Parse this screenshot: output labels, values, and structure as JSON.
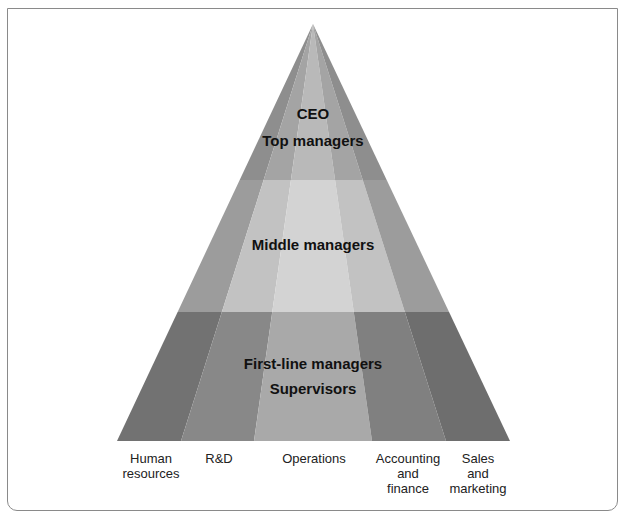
{
  "diagram": {
    "type": "pyramid",
    "tiers": [
      {
        "id": "top",
        "lines": [
          "CEO",
          "Top managers"
        ]
      },
      {
        "id": "middle",
        "lines": [
          "Middle managers"
        ]
      },
      {
        "id": "bottom",
        "lines": [
          "First-line managers",
          "Supervisors"
        ]
      }
    ],
    "columns": [
      {
        "label_lines": [
          "Human",
          "resources"
        ]
      },
      {
        "label_lines": [
          "R&D"
        ]
      },
      {
        "label_lines": [
          "Operations"
        ]
      },
      {
        "label_lines": [
          "Accounting",
          "and",
          "finance"
        ]
      },
      {
        "label_lines": [
          "Sales",
          "and",
          "marketing"
        ]
      }
    ],
    "colors": {
      "top": [
        "#8e8e8e",
        "#a4a4a4",
        "#b9b9b9",
        "#a4a4a4",
        "#8e8e8e"
      ],
      "middle": [
        "#9c9c9c",
        "#c2c2c2",
        "#d3d3d3",
        "#c2c2c2",
        "#9c9c9c"
      ],
      "bottom": [
        "#727272",
        "#888888",
        "#a9a9a9",
        "#808080",
        "#6e6e6e"
      ]
    }
  }
}
